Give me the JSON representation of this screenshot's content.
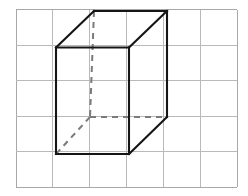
{
  "figure": {
    "canvas": {
      "width": 248,
      "height": 196,
      "background": "#ffffff"
    },
    "grid": {
      "name": "square-grid",
      "columns": 6,
      "rows": 5,
      "x_start": 16,
      "y_start": 9.5,
      "cell_width": 36.9,
      "cell_height": 35.5,
      "line_color": "#b9b9b9",
      "line_width": 1,
      "x_lines": [
        16,
        52.9,
        89.8,
        126.7,
        163.6,
        200.5,
        237.4
      ],
      "y_lines": [
        9.5,
        45,
        80.5,
        116,
        151.5,
        187
      ]
    },
    "shape": {
      "name": "cube",
      "projection": "oblique",
      "solid_color": "#151515",
      "hidden_color": "#7b7b7b",
      "solid_width": 2.1,
      "hidden_width": 2.0,
      "hidden_dash": "6 5",
      "vertices": {
        "front_top_left": [
          56,
          47.5
        ],
        "front_top_right": [
          129,
          47.5
        ],
        "front_bottom_right": [
          129,
          154
        ],
        "front_bottom_left": [
          56,
          154
        ],
        "back_top_left": [
          94,
          11
        ],
        "back_top_right": [
          167,
          11
        ],
        "back_bottom_right": [
          167,
          117
        ],
        "back_bottom_left": [
          90,
          117
        ]
      },
      "solid_edges": [
        {
          "name": "front-top-edge",
          "from": "front_top_left",
          "to": "front_top_right"
        },
        {
          "name": "front-right-edge",
          "from": "front_top_right",
          "to": "front_bottom_right"
        },
        {
          "name": "front-bottom-edge",
          "from": "front_bottom_right",
          "to": "front_bottom_left"
        },
        {
          "name": "front-left-edge",
          "from": "front_bottom_left",
          "to": "front_top_left"
        },
        {
          "name": "back-top-edge",
          "from": "back_top_left",
          "to": "back_top_right"
        },
        {
          "name": "back-right-edge",
          "from": "back_top_right",
          "to": "back_bottom_right"
        },
        {
          "name": "top-left-diagonal",
          "from": "front_top_left",
          "to": "back_top_left"
        },
        {
          "name": "top-right-diagonal",
          "from": "front_top_right",
          "to": "back_top_right"
        },
        {
          "name": "bottom-right-diagonal",
          "from": "front_bottom_right",
          "to": "back_bottom_right"
        }
      ],
      "hidden_edges": [
        {
          "name": "back-left-edge",
          "from": "back_top_left",
          "to": "back_bottom_left"
        },
        {
          "name": "back-bottom-edge",
          "from": "back_bottom_left",
          "to": "back_bottom_right"
        },
        {
          "name": "bottom-left-diagonal",
          "from": "back_bottom_left",
          "to": "front_bottom_left"
        }
      ]
    }
  }
}
